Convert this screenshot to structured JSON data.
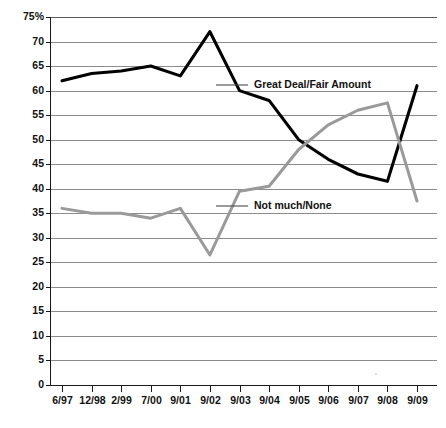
{
  "chart_data": {
    "type": "line",
    "title": "",
    "xlabel": "",
    "ylabel": "",
    "ylim": [
      0,
      75
    ],
    "ytick_step": 5,
    "grid": true,
    "legend": "inline-annotation",
    "y_axis_top_label": "75%",
    "categories": [
      "6/97",
      "12/98",
      "2/99",
      "7/00",
      "9/01",
      "9/02",
      "9/03",
      "9/04",
      "9/05",
      "9/06",
      "9/07",
      "9/08",
      "9/09"
    ],
    "yticks": [
      "0",
      "5",
      "10",
      "15",
      "20",
      "25",
      "30",
      "35",
      "40",
      "45",
      "50",
      "55",
      "60",
      "65",
      "70",
      "75%"
    ],
    "series": [
      {
        "name": "Great Deal/Fair Amount",
        "color": "#000000",
        "values": [
          62,
          63.5,
          64,
          65,
          63,
          72,
          60,
          58,
          50,
          46,
          43,
          41.5,
          61
        ]
      },
      {
        "name": "Not much/None",
        "color": "#9a9a9a",
        "values": [
          36,
          35,
          35,
          34,
          36,
          26.5,
          39.5,
          40.5,
          48,
          53,
          56,
          57.5,
          37.5
        ]
      }
    ],
    "annotations": [
      {
        "text": "Great Deal/Fair Amount",
        "series": "Great Deal/Fair Amount",
        "x_px": 254,
        "y_px": 85
      },
      {
        "text": "Not much/None",
        "series": "Not much/None",
        "x_px": 254,
        "y_px": 206
      }
    ]
  },
  "colors": {
    "primary_series": "#000000",
    "secondary_series": "#9a9a9a",
    "gridline": "#8c8c8c",
    "axis": "#1a1a1a",
    "text": "#111111",
    "background": "#ffffff"
  }
}
